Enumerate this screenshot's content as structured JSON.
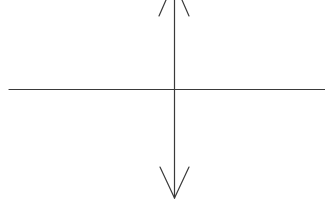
{
  "diagram": {
    "type": "axes-cross",
    "stroke_color": "#3a3a3a",
    "background": "#ffffff",
    "vertical_axis": {
      "x": 174.5,
      "y1": 0,
      "y2": 198,
      "top_arrow": "open-chevron-up",
      "bottom_arrow": "open-chevron-down"
    },
    "horizontal_axis": {
      "y": 89.5,
      "x1": 9,
      "x2": 325
    },
    "top_arrowhead": {
      "left": [
        159,
        16,
        166,
        0
      ],
      "right": [
        189,
        16,
        182,
        0
      ]
    },
    "bottom_arrowhead": {
      "left": [
        160,
        167,
        174.5,
        198
      ],
      "right": [
        189,
        167,
        174.5,
        198
      ]
    }
  }
}
